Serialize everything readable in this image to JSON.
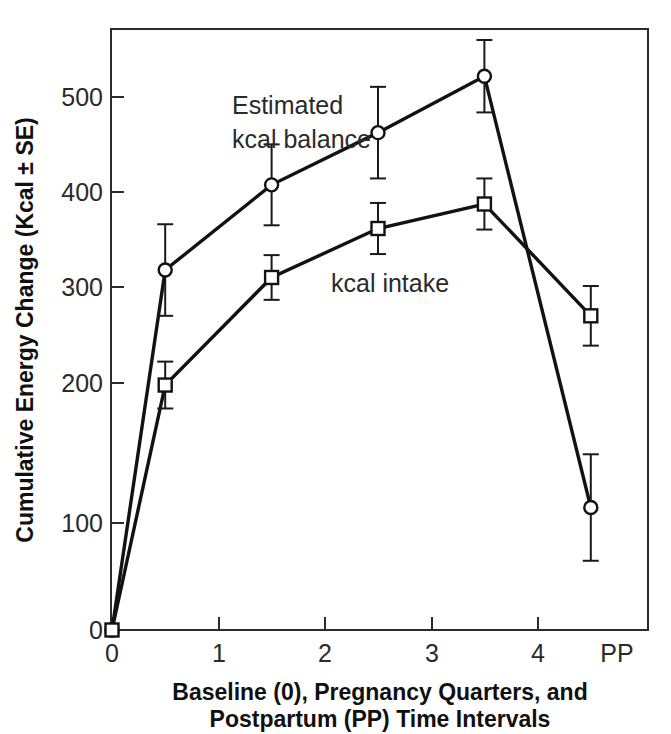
{
  "chart_data": {
    "type": "line",
    "title": "",
    "subtitle": "",
    "xlabel_line1": "Baseline (0), Pregnancy Quarters, and",
    "xlabel_line2": "Postpartum (PP) Time Intervals",
    "ylabel": "Cumulative Energy Change (Kcal ± SE)",
    "x": [
      0,
      0.5,
      1.5,
      2.5,
      3.5,
      4.5
    ],
    "xtick_positions": [
      0,
      1,
      2,
      3,
      4,
      4.5
    ],
    "xtick_labels": [
      "0",
      "1",
      "2",
      "3",
      "4",
      "PP"
    ],
    "ytick_positions": [
      0,
      100,
      200,
      300,
      400,
      500
    ],
    "ytick_labels": [
      "0",
      "100",
      "200",
      "300",
      "400",
      "500"
    ],
    "xlim": [
      -0.08,
      5.05
    ],
    "ylim": [
      0,
      565
    ],
    "grid": false,
    "legend_position": "inline-annotations",
    "series": [
      {
        "name": "Estimated kcal balance",
        "marker": "circle",
        "values": [
          0,
          338,
          418,
          467,
          520,
          115
        ],
        "errors": [
          0,
          43,
          38,
          43,
          34,
          50
        ],
        "annotation_line1": "Estimated",
        "annotation_line2": "kcal balance"
      },
      {
        "name": "kcal intake",
        "marker": "square",
        "values": [
          0,
          230,
          331,
          377,
          400,
          295
        ],
        "errors": [
          0,
          22,
          21,
          24,
          24,
          28
        ],
        "annotation_line1": "kcal intake",
        "annotation_line2": ""
      }
    ],
    "colors": {
      "line": "#121212",
      "frame": "#2b2b2b",
      "text": "#101010",
      "tick_text": "#2a2a2a",
      "background": "#ffffff",
      "marker_fill": "#ffffff"
    }
  },
  "annotations": {
    "estimated_balance_l1": "Estimated",
    "estimated_balance_l2": "kcal balance",
    "kcal_intake": "kcal intake"
  },
  "axes": {
    "y_title": "Cumulative Energy Change (Kcal ± SE)",
    "x_title_l1": "Baseline (0), Pregnancy Quarters, and",
    "x_title_l2": "Postpartum (PP) Time Intervals",
    "y_ticks": [
      "500",
      "400",
      "300",
      "200",
      "100",
      "0"
    ],
    "x_ticks": [
      "0",
      "1",
      "2",
      "3",
      "4",
      "PP"
    ]
  }
}
